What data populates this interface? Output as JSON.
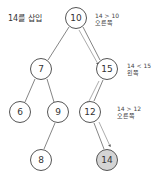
{
  "title": "14를 삽입",
  "colors": {
    "edge": "#666666",
    "node_border": "#555555",
    "inserted_fill": "#d4d4d4",
    "path_arrow": "#777777"
  },
  "nodes": [
    {
      "id": "n10",
      "value": "10",
      "cx": 76,
      "cy": 18
    },
    {
      "id": "n7",
      "value": "7",
      "cx": 41,
      "cy": 69
    },
    {
      "id": "n15",
      "value": "15",
      "cx": 107,
      "cy": 69
    },
    {
      "id": "n6",
      "value": "6",
      "cx": 20,
      "cy": 112
    },
    {
      "id": "n9",
      "value": "9",
      "cx": 58,
      "cy": 112
    },
    {
      "id": "n12",
      "value": "12",
      "cx": 90,
      "cy": 112
    },
    {
      "id": "n8",
      "value": "8",
      "cx": 41,
      "cy": 160
    },
    {
      "id": "n14",
      "value": "14",
      "cx": 107,
      "cy": 160,
      "inserted": true
    }
  ],
  "edges": [
    [
      "10",
      "7"
    ],
    [
      "10",
      "15"
    ],
    [
      "7",
      "6"
    ],
    [
      "7",
      "9"
    ],
    [
      "15",
      "12"
    ],
    [
      "9",
      "8"
    ],
    [
      "12",
      "14"
    ]
  ],
  "annotations": [
    {
      "comparison": "14 > 10",
      "direction": "오른쪽"
    },
    {
      "comparison": "14 < 15",
      "direction": "왼쪽"
    },
    {
      "comparison": "14 > 12",
      "direction": "오른쪽"
    }
  ]
}
